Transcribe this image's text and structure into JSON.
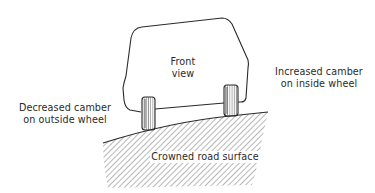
{
  "figure": {
    "labels": {
      "front_view": [
        "Front",
        "view"
      ],
      "outside_wheel": [
        "Decreased camber",
        "on outside wheel"
      ],
      "inside_wheel": [
        "Increased camber",
        "on inside wheel"
      ],
      "road": "Crowned road surface"
    },
    "colors": {
      "line": "#2a2a2a",
      "hatch": "#4a4a4a",
      "background": "#ffffff"
    }
  }
}
